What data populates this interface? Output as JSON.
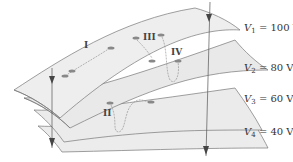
{
  "figure": {
    "surfaces": [
      {
        "name": "V1",
        "symbol": "V",
        "sub": "1",
        "value": "= 100 V"
      },
      {
        "name": "V2",
        "symbol": "V",
        "sub": "2",
        "value": "= 80 V"
      },
      {
        "name": "V3",
        "symbol": "V",
        "sub": "3",
        "value": "= 60 V"
      },
      {
        "name": "V4",
        "symbol": "V",
        "sub": "4",
        "value": "= 40 V"
      }
    ],
    "paths": [
      {
        "label": "I"
      },
      {
        "label": "II"
      },
      {
        "label": "III"
      },
      {
        "label": "IV"
      }
    ]
  }
}
